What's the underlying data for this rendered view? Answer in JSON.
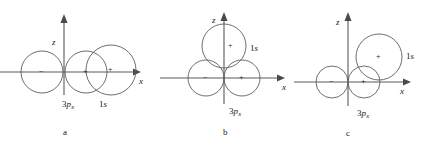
{
  "figure": {
    "width": 425,
    "height": 153,
    "background": "#ffffff",
    "line_color": "#5e5e5e",
    "axis_color": "#5a5a5a",
    "text_color": "#1a1a1a"
  },
  "panels": [
    {
      "id": "a",
      "letter": "a",
      "axes": {
        "z_label": "z",
        "x_label": "x",
        "origin": {
          "x": 64,
          "y": 72
        },
        "z_tip": {
          "x": 64,
          "y": 18
        },
        "x_tip": {
          "x": 138,
          "y": 72
        }
      },
      "orbitals": [
        {
          "name": "3p-x-negative-lobe",
          "label": "3p",
          "sublabel": "x",
          "sign": "−",
          "cx": 42,
          "cy": 72,
          "r": 21,
          "sign_x": 39,
          "sign_y": 70
        },
        {
          "name": "3p-x-positive-lobe",
          "label": "3p",
          "sublabel": "x",
          "sign": "+",
          "cx": 86,
          "cy": 72,
          "r": 21,
          "sign_x": 83,
          "sign_y": 70
        },
        {
          "name": "1s-orbital",
          "label": "1s",
          "sublabel": "",
          "sign": "+",
          "cx": 111,
          "cy": 70,
          "r": 25,
          "sign_x": 108,
          "sign_y": 68
        }
      ],
      "orbital_labels": [
        {
          "name": "3p-x-label",
          "text_main": "3",
          "text_italic": "p",
          "text_sub": "x",
          "x": 62,
          "y": 104
        },
        {
          "name": "1s-label",
          "text_main": "1",
          "text_italic": "s",
          "text_sub": "",
          "x": 99,
          "y": 104
        }
      ],
      "letter_pos": {
        "x": 63,
        "y": 132
      }
    },
    {
      "id": "b",
      "letter": "b",
      "axes": {
        "z_label": "z",
        "x_label": "x",
        "origin": {
          "x": 224,
          "y": 78
        },
        "z_tip": {
          "x": 224,
          "y": 16
        },
        "x_tip": {
          "x": 285,
          "y": 78
        }
      },
      "orbitals": [
        {
          "name": "3p-x-negative-lobe",
          "label": "3p",
          "sublabel": "x",
          "sign": "−",
          "cx": 206,
          "cy": 78,
          "r": 18,
          "sign_x": 203,
          "sign_y": 76
        },
        {
          "name": "3p-x-positive-lobe",
          "label": "3p",
          "sublabel": "x",
          "sign": "+",
          "cx": 242,
          "cy": 78,
          "r": 18,
          "sign_x": 239,
          "sign_y": 76
        },
        {
          "name": "1s-orbital",
          "label": "1s",
          "sublabel": "",
          "sign": "+",
          "cx": 224,
          "cy": 46,
          "r": 22,
          "sign_x": 221,
          "sign_y": 44
        }
      ],
      "orbital_labels": [
        {
          "name": "3p-x-label",
          "text_main": "3",
          "text_italic": "p",
          "text_sub": "x",
          "x": 229,
          "y": 111
        },
        {
          "name": "1s-label",
          "text_main": "1",
          "text_italic": "s",
          "text_sub": "",
          "x": 250,
          "y": 48
        }
      ],
      "letter_pos": {
        "x": 223,
        "y": 132
      }
    },
    {
      "id": "c",
      "letter": "c",
      "axes": {
        "z_label": "z",
        "x_label": "x",
        "origin": {
          "x": 348,
          "y": 82
        },
        "z_tip": {
          "x": 348,
          "y": 16
        },
        "x_tip": {
          "x": 410,
          "y": 82
        }
      },
      "orbitals": [
        {
          "name": "3p-x-negative-lobe",
          "label": "3p",
          "sublabel": "x",
          "sign": "−",
          "cx": 332,
          "cy": 82,
          "r": 16,
          "sign_x": 329,
          "sign_y": 80
        },
        {
          "name": "3p-x-positive-lobe",
          "label": "3p",
          "sublabel": "x",
          "sign": "+",
          "cx": 364,
          "cy": 82,
          "r": 16,
          "sign_x": 361,
          "sign_y": 80
        },
        {
          "name": "1s-orbital",
          "label": "1s",
          "sublabel": "",
          "sign": "+",
          "cx": 379,
          "cy": 57,
          "r": 23,
          "sign_x": 376,
          "sign_y": 55
        }
      ],
      "orbital_labels": [
        {
          "name": "3p-x-label",
          "text_main": "3",
          "text_italic": "p",
          "text_sub": "x",
          "x": 357,
          "y": 113
        },
        {
          "name": "1s-label",
          "text_main": "1",
          "text_italic": "s",
          "text_sub": "",
          "x": 406,
          "y": 56
        }
      ],
      "letter_pos": {
        "x": 346,
        "y": 133
      }
    }
  ]
}
